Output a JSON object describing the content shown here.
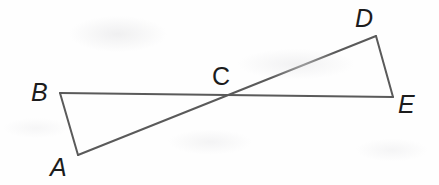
{
  "figure": {
    "kind": "geometry-diagram",
    "background_color": "#fefefe",
    "stroke_color": "#5a5a5a",
    "label_color": "#1c1c1c",
    "stroke_width": 2,
    "width": 439,
    "height": 185
  },
  "points": {
    "A": {
      "label": "A",
      "x": 78,
      "y": 155,
      "label_x": 50,
      "label_y": 155,
      "italic": true
    },
    "B": {
      "label": "B",
      "x": 60,
      "y": 93,
      "label_x": 31,
      "label_y": 80,
      "italic": true
    },
    "C": {
      "label": "C",
      "x": 232,
      "y": 97,
      "label_x": 212,
      "label_y": 64,
      "italic": false
    },
    "D": {
      "label": "D",
      "x": 376,
      "y": 36,
      "label_x": 355,
      "label_y": 6,
      "italic": true
    },
    "E": {
      "label": "E",
      "x": 393,
      "y": 97,
      "label_x": 398,
      "label_y": 92,
      "italic": true
    }
  },
  "segments": [
    {
      "name": "segment-BE",
      "from": "B",
      "to": "E",
      "x1": 60,
      "y1": 93,
      "x2": 393,
      "y2": 97
    },
    {
      "name": "segment-AD",
      "from": "A",
      "to": "D",
      "x1": 78,
      "y1": 155,
      "x2": 376,
      "y2": 36
    },
    {
      "name": "segment-BA",
      "from": "B",
      "to": "A",
      "x1": 60,
      "y1": 93,
      "x2": 78,
      "y2": 155
    },
    {
      "name": "segment-DE",
      "from": "D",
      "to": "E",
      "x1": 376,
      "y1": 36,
      "x2": 393,
      "y2": 97
    }
  ],
  "labels_order": [
    "B",
    "A",
    "C",
    "D",
    "E"
  ]
}
